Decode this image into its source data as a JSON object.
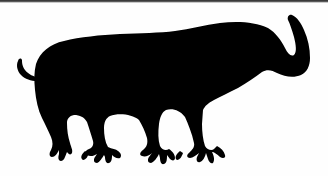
{
  "image": {
    "subject": "black animal silhouette (buffalo-like creature with curled trunk and tail)",
    "background_color": "#ffffff",
    "silhouette_color": "#000000",
    "border_color": "#3a3a3a"
  }
}
